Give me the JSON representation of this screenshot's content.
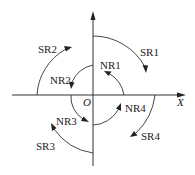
{
  "diagram": {
    "type": "quadrant-arc-diagram",
    "origin_label": "O",
    "x_axis_label": "X",
    "colors": {
      "stroke": "#333333",
      "text": "#222222",
      "background": "#ffffff"
    },
    "arcs": [
      {
        "id": "SR1",
        "label": "SR1",
        "ring": "outer",
        "quadrant": 1,
        "direction": "clockwise"
      },
      {
        "id": "SR2",
        "label": "SR2",
        "ring": "outer",
        "quadrant": 2,
        "direction": "clockwise"
      },
      {
        "id": "SR3",
        "label": "SR3",
        "ring": "outer",
        "quadrant": 3,
        "direction": "clockwise"
      },
      {
        "id": "SR4",
        "label": "SR4",
        "ring": "outer",
        "quadrant": 4,
        "direction": "clockwise"
      },
      {
        "id": "NR1",
        "label": "NR1",
        "ring": "inner",
        "quadrant": 1,
        "direction": "counterclockwise"
      },
      {
        "id": "NR2",
        "label": "NR2",
        "ring": "inner",
        "quadrant": 2,
        "direction": "counterclockwise"
      },
      {
        "id": "NR3",
        "label": "NR3",
        "ring": "inner",
        "quadrant": 3,
        "direction": "counterclockwise"
      },
      {
        "id": "NR4",
        "label": "NR4",
        "ring": "inner",
        "quadrant": 4,
        "direction": "counterclockwise"
      }
    ]
  }
}
